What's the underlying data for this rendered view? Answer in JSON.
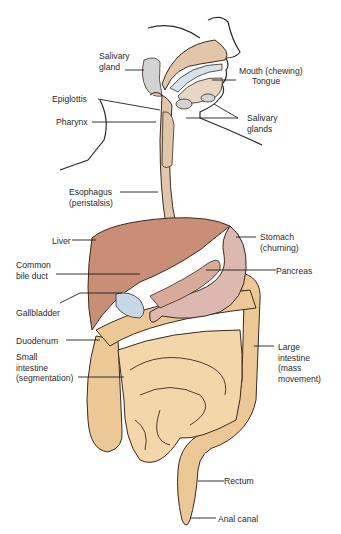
{
  "colors": {
    "liver": "#c98e78",
    "stomach": "#dcb8b0",
    "gallbladder": "#c6d8e6",
    "intestine": "#f3d6aa",
    "large_intestine": "#ecc896",
    "esophagus": "#e2c6aa",
    "salivary": "#d3d3d3",
    "outline": "#3a2a20",
    "leader_line": "#1e1e1e"
  },
  "labels": {
    "salivary_gland": "Salivary\ngland",
    "mouth": "Mouth (chewing)",
    "tongue": "Tongue",
    "epiglottis": "Epiglottis",
    "pharynx": "Pharynx",
    "salivary_glands": "Salivary\nglands",
    "esophagus": "Esophagus\n(peristalsis)",
    "liver": "Liver",
    "stomach": "Stomach\n(churning)",
    "common_bile_duct": "Common\nbile duct",
    "pancreas": "Pancreas",
    "gallbladder": "Gallbladder",
    "duodenum": "Duodenum",
    "small_intestine": "Small\nintestine\n(segmentation)",
    "large_intestine": "Large\nintestine\n(mass\nmovement)",
    "rectum": "Rectum",
    "anal_canal": "Anal canal"
  }
}
